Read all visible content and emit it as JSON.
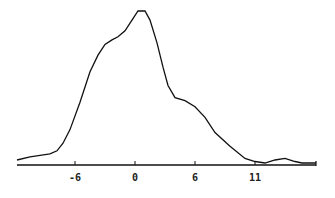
{
  "chart_data": {
    "type": "line",
    "title": "",
    "xlabel": "",
    "ylabel": "",
    "grid": false,
    "legend": null,
    "x_ticks": [
      {
        "value": -6,
        "label": "-6"
      },
      {
        "value": 0,
        "label": "0"
      },
      {
        "value": 6,
        "label": "6"
      },
      {
        "value": 12,
        "label": "11"
      }
    ],
    "xlim": [
      -11.8,
      18.1
    ],
    "ylim": [
      0,
      1.0
    ],
    "series": [
      {
        "name": "density",
        "color": "#111111",
        "x": [
          -11.8,
          -10.5,
          -9.5,
          -8.5,
          -7.8,
          -7.2,
          -6.5,
          -5.5,
          -4.5,
          -3.7,
          -3.0,
          -2.3,
          -1.7,
          -1.0,
          -0.3,
          0.3,
          1.0,
          1.5,
          2.2,
          2.8,
          3.3,
          4.0,
          5.0,
          6.0,
          7.0,
          8.0,
          9.5,
          11.0,
          12.0,
          13.0,
          14.0,
          15.0,
          16.0,
          16.7,
          18.1
        ],
        "y": [
          0.02,
          0.04,
          0.05,
          0.06,
          0.08,
          0.13,
          0.22,
          0.4,
          0.6,
          0.71,
          0.78,
          0.81,
          0.83,
          0.87,
          0.94,
          1.0,
          1.0,
          0.94,
          0.79,
          0.63,
          0.51,
          0.43,
          0.41,
          0.37,
          0.3,
          0.2,
          0.11,
          0.03,
          0.01,
          0.0,
          0.02,
          0.03,
          0.01,
          0.0,
          0.0
        ]
      }
    ]
  }
}
